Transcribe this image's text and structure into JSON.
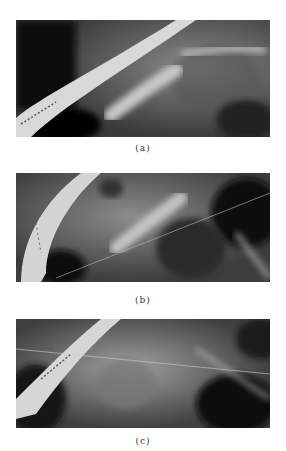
{
  "figure": {
    "panels": [
      {
        "id": "a",
        "caption": "(a)",
        "description": "fluoroscopic x-ray image with stent/catheter (panel a)"
      },
      {
        "id": "b",
        "caption": "(b)",
        "description": "fluoroscopic x-ray image with stent/catheter (panel b)"
      },
      {
        "id": "c",
        "caption": "(c)",
        "description": "fluoroscopic x-ray image with stent/catheter (panel c)"
      }
    ]
  }
}
